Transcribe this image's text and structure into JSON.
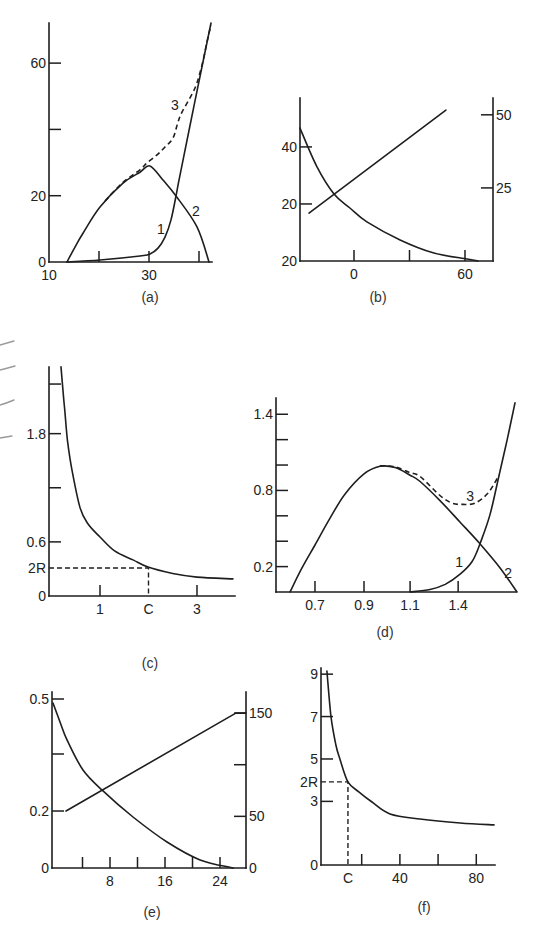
{
  "chart_data": [
    {
      "panel": "a",
      "caption": "(a)",
      "type": "line",
      "xlim": [
        10,
        42.6
      ],
      "ylim": [
        0,
        72.1
      ],
      "grid": false,
      "x_ticks": [
        {
          "v": 10,
          "label": "10",
          "mark": false
        },
        {
          "v": 20,
          "label": ""
        },
        {
          "v": 30,
          "label": "30"
        },
        {
          "v": 40,
          "label": ""
        }
      ],
      "y_ticks": [
        {
          "v": 0,
          "label": "0",
          "mark": false
        },
        {
          "v": 20,
          "label": "20"
        },
        {
          "v": 40,
          "label": ""
        },
        {
          "v": 60,
          "label": "60"
        }
      ],
      "series": [
        {
          "name": "1",
          "style": "solid",
          "axis": "left",
          "points": [
            [
              13.6,
              0
            ],
            [
              20.2,
              0.6
            ],
            [
              28.2,
              1.8
            ],
            [
              30.2,
              2.4
            ],
            [
              31.8,
              4.2
            ],
            [
              33.2,
              7.5
            ],
            [
              34.4,
              12.7
            ],
            [
              35.4,
              19.9
            ],
            [
              36.2,
              26.2
            ],
            [
              39.2,
              48.6
            ],
            [
              42.4,
              72.1
            ]
          ]
        },
        {
          "name": "2",
          "style": "solid",
          "axis": "left",
          "points": [
            [
              13.6,
              0
            ],
            [
              15.2,
              4.5
            ],
            [
              16.8,
              8.7
            ],
            [
              20.2,
              16.6
            ],
            [
              24.8,
              23.8
            ],
            [
              28.2,
              27.1
            ],
            [
              30.2,
              29.0
            ],
            [
              32.8,
              24.7
            ],
            [
              35.4,
              19.9
            ],
            [
              39.6,
              10.6
            ],
            [
              42.0,
              0
            ]
          ]
        },
        {
          "name": "3",
          "style": "dashed",
          "axis": "left",
          "points": [
            [
              21.2,
              18.4
            ],
            [
              24.8,
              24.0
            ],
            [
              28.2,
              27.8
            ],
            [
              29.6,
              29.9
            ],
            [
              31.6,
              32.3
            ],
            [
              33.2,
              34.7
            ],
            [
              34.8,
              37.4
            ],
            [
              35.8,
              42.2
            ],
            [
              36.6,
              45.2
            ],
            [
              39.2,
              52.5
            ],
            [
              40.6,
              59.4
            ],
            [
              41.6,
              66.4
            ],
            [
              42.4,
              71.5
            ]
          ]
        }
      ],
      "annotations": [
        {
          "text": "1",
          "x": 32.4,
          "y": 10.0
        },
        {
          "text": "2",
          "x": 39.4,
          "y": 15.4
        },
        {
          "text": "3",
          "x": 35.2,
          "y": 47.4
        }
      ]
    },
    {
      "panel": "b",
      "caption": "(b)",
      "type": "line",
      "xlim": [
        -29.19,
        75.14
      ],
      "ylim": [
        0,
        57.15
      ],
      "ylim_right": [
        0,
        55.75
      ],
      "grid": false,
      "x_ticks": [
        {
          "v": 0,
          "label": "0"
        },
        {
          "v": 30,
          "label": ""
        },
        {
          "v": 60,
          "label": "60"
        }
      ],
      "y_ticks": [
        {
          "v": 0,
          "label": "20",
          "mark": false
        },
        {
          "v": 20,
          "label": "20"
        },
        {
          "v": 40,
          "label": "40"
        }
      ],
      "y_right_ticks": [
        {
          "v": 25,
          "label": "25"
        },
        {
          "v": 50,
          "label": "50"
        }
      ],
      "series": [
        {
          "name": "decreasing",
          "style": "solid",
          "axis": "left",
          "points": [
            [
              -29.2,
              46.6
            ],
            [
              -20.0,
              33.0
            ],
            [
              -10.8,
              23.5
            ],
            [
              -2.2,
              18.6
            ],
            [
              7.0,
              13.7
            ],
            [
              24.9,
              7.4
            ],
            [
              43.2,
              2.8
            ],
            [
              61.1,
              0.7
            ],
            [
              67.0,
              0
            ]
          ]
        },
        {
          "name": "increasing",
          "style": "solid",
          "axis": "right",
          "interp": "linear",
          "points": [
            [
              -24.3,
              16.4
            ],
            [
              49.7,
              51.6
            ]
          ]
        }
      ],
      "annotations": []
    },
    {
      "panel": "c",
      "caption": "(c)",
      "type": "line",
      "xlim": [
        -0.052,
        3.784
      ],
      "ylim": [
        0,
        2.539
      ],
      "grid": false,
      "x_ticks": [
        {
          "v": 1,
          "label": "1"
        },
        {
          "v": 2,
          "label": "C",
          "mark": false
        },
        {
          "v": 3,
          "label": "3"
        }
      ],
      "y_ticks": [
        {
          "v": 0,
          "label": "0",
          "mark": false
        },
        {
          "v": 0.31,
          "label": "2R",
          "mark": false
        },
        {
          "v": 0.6,
          "label": "0.6"
        },
        {
          "v": 1.2,
          "label": ""
        },
        {
          "v": 1.8,
          "label": "1.8"
        },
        {
          "v": 2.35,
          "label": ""
        }
      ],
      "ref_lines": [
        {
          "x": 2.0,
          "y": 0.31,
          "x_label": "C",
          "y_label": "2R"
        }
      ],
      "series": [
        {
          "name": "curve",
          "style": "solid",
          "axis": "left",
          "points": [
            [
              0.196,
              2.54
            ],
            [
              0.24,
              2.25
            ],
            [
              0.278,
              2.03
            ],
            [
              0.33,
              1.72
            ],
            [
              0.42,
              1.4
            ],
            [
              0.588,
              0.98
            ],
            [
              0.75,
              0.8
            ],
            [
              1.0,
              0.654
            ],
            [
              1.3,
              0.5
            ],
            [
              1.68,
              0.4
            ],
            [
              1.99,
              0.32
            ],
            [
              2.5,
              0.25
            ],
            [
              3.0,
              0.21
            ],
            [
              3.74,
              0.19
            ]
          ]
        }
      ],
      "annotations": []
    },
    {
      "panel": "d",
      "caption": "(d)",
      "type": "line",
      "xlim": [
        0.541,
        1.52
      ],
      "ylim": [
        0,
        1.528
      ],
      "grid": false,
      "x_ticks": [
        {
          "v": 0.7,
          "label": "0.7"
        },
        {
          "v": 0.9,
          "label": "0.9"
        },
        {
          "v": 1.088,
          "label": "1.1"
        },
        {
          "v": 1.284,
          "label": "1.4"
        }
      ],
      "y_ticks": [
        {
          "v": 0.2,
          "label": "0.2"
        },
        {
          "v": 0.4,
          "label": ""
        },
        {
          "v": 0.6,
          "label": ""
        },
        {
          "v": 0.8,
          "label": "0.8"
        },
        {
          "v": 1.0,
          "label": ""
        },
        {
          "v": 1.2,
          "label": ""
        },
        {
          "v": 1.4,
          "label": "1.4"
        }
      ],
      "series": [
        {
          "name": "1",
          "style": "solid",
          "axis": "left",
          "points": [
            [
              1.088,
              0
            ],
            [
              1.169,
              0.02
            ],
            [
              1.231,
              0.06
            ],
            [
              1.292,
              0.14
            ],
            [
              1.341,
              0.24
            ],
            [
              1.373,
              0.38
            ],
            [
              1.414,
              0.61
            ],
            [
              1.451,
              0.92
            ],
            [
              1.484,
              1.2
            ],
            [
              1.516,
              1.49
            ]
          ]
        },
        {
          "name": "2",
          "style": "solid",
          "axis": "left",
          "points": [
            [
              0.598,
              0
            ],
            [
              0.647,
              0.19
            ],
            [
              0.7,
              0.37
            ],
            [
              0.761,
              0.58
            ],
            [
              0.822,
              0.77
            ],
            [
              0.9,
              0.93
            ],
            [
              0.965,
              0.99
            ],
            [
              1.027,
              0.98
            ],
            [
              1.088,
              0.92
            ],
            [
              1.129,
              0.87
            ],
            [
              1.21,
              0.72
            ],
            [
              1.292,
              0.55
            ],
            [
              1.373,
              0.38
            ],
            [
              1.455,
              0.19
            ],
            [
              1.524,
              0
            ]
          ]
        },
        {
          "name": "3",
          "style": "dashed",
          "axis": "left",
          "points": [
            [
              0.965,
              0.995
            ],
            [
              1.027,
              0.985
            ],
            [
              1.088,
              0.94
            ],
            [
              1.129,
              0.91
            ],
            [
              1.21,
              0.76
            ],
            [
              1.259,
              0.7
            ],
            [
              1.304,
              0.69
            ],
            [
              1.353,
              0.7
            ],
            [
              1.406,
              0.78
            ],
            [
              1.451,
              0.92
            ]
          ]
        }
      ],
      "annotations": [
        {
          "text": "3",
          "x": 1.333,
          "y": 0.76
        },
        {
          "text": "1",
          "x": 1.288,
          "y": 0.24
        },
        {
          "text": "2",
          "x": 1.488,
          "y": 0.15
        }
      ]
    },
    {
      "panel": "e",
      "caption": "(e)",
      "type": "line",
      "xlim": [
        -0.436,
        27.78
      ],
      "ylim": [
        0,
        0.5207
      ],
      "ylim_right": [
        0,
        170.4
      ],
      "grid": false,
      "x_ticks": [
        {
          "v": 4,
          "label": ""
        },
        {
          "v": 8,
          "label": "8"
        },
        {
          "v": 12,
          "label": ""
        },
        {
          "v": 16,
          "label": "16"
        },
        {
          "v": 20,
          "label": ""
        },
        {
          "v": 24,
          "label": "24"
        }
      ],
      "y_ticks": [
        {
          "v": 0,
          "label": "0",
          "mark": false
        },
        {
          "v": 0.1686,
          "label": "0.2"
        },
        {
          "v": 0.3373,
          "label": ""
        },
        {
          "v": 0.5,
          "label": "0.5"
        }
      ],
      "y_right_ticks": [
        {
          "v": 0,
          "label": "0",
          "mark": false
        },
        {
          "v": 50,
          "label": "50"
        },
        {
          "v": 100,
          "label": ""
        },
        {
          "v": 150,
          "label": "150"
        }
      ],
      "series": [
        {
          "name": "decreasing",
          "style": "solid",
          "axis": "left",
          "points": [
            [
              -0.29,
              0.488
            ],
            [
              0.73,
              0.432
            ],
            [
              1.75,
              0.379
            ],
            [
              4.07,
              0.29
            ],
            [
              6.98,
              0.228
            ],
            [
              11.35,
              0.151
            ],
            [
              16.29,
              0.077
            ],
            [
              21.1,
              0.024
            ],
            [
              25.9,
              0
            ]
          ]
        },
        {
          "name": "increasing",
          "style": "solid",
          "axis": "right",
          "interp": "linear",
          "points": [
            [
              1.6,
              55.2
            ],
            [
              26.3,
              150
            ],
            [
              27.78,
              150
            ]
          ]
        }
      ],
      "annotations": []
    },
    {
      "panel": "f",
      "caption": "(f)",
      "type": "line",
      "xlim": [
        -1.31,
        89.8
      ],
      "ylim": [
        0,
        9.29
      ],
      "grid": false,
      "x_ticks": [
        {
          "v": 12.8,
          "label": "C",
          "mark": false
        },
        {
          "v": 20,
          "label": ""
        },
        {
          "v": 40,
          "label": "40"
        },
        {
          "v": 60,
          "label": ""
        },
        {
          "v": 80,
          "label": "80"
        }
      ],
      "y_ticks": [
        {
          "v": 0,
          "label": "0",
          "mark": false
        },
        {
          "v": 3,
          "label": "3"
        },
        {
          "v": 3.92,
          "label": "2R",
          "mark": false
        },
        {
          "v": 5,
          "label": "5"
        },
        {
          "v": 7,
          "label": "7"
        },
        {
          "v": 9,
          "label": "9"
        }
      ],
      "ref_lines": [
        {
          "x": 12.8,
          "y": 3.92,
          "x_label": "C",
          "y_label": "2R"
        }
      ],
      "series": [
        {
          "name": "curve",
          "style": "solid",
          "axis": "left",
          "points": [
            [
              1.8,
              9.15
            ],
            [
              3.9,
              7.03
            ],
            [
              6.5,
              5.66
            ],
            [
              8.6,
              5.0
            ],
            [
              12.8,
              3.92
            ],
            [
              18.5,
              3.45
            ],
            [
              25.4,
              2.97
            ],
            [
              34.8,
              2.41
            ],
            [
              50.5,
              2.17
            ],
            [
              71.5,
              1.98
            ],
            [
              89.3,
              1.89
            ]
          ]
        }
      ],
      "annotations": []
    }
  ]
}
